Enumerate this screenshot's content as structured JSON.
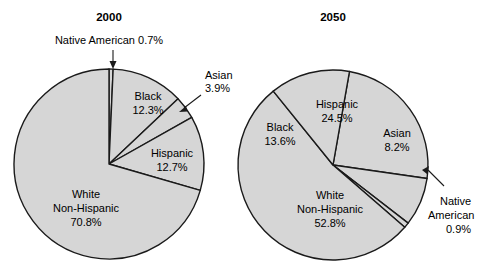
{
  "figure": {
    "background_color": "#ffffff",
    "slice_fill_color": "#d6d6d6",
    "outline_color": "#1a1a1a"
  },
  "chart_data": [
    {
      "type": "pie",
      "title": "2000",
      "categories": [
        "Native American",
        "Black",
        "Asian",
        "Hispanic",
        "White Non-Hispanic"
      ],
      "values": [
        0.7,
        12.3,
        3.9,
        12.7,
        70.8
      ],
      "value_labels": [
        "0.7%",
        "12.3%",
        "3.9%",
        "12.7%",
        "70.8%"
      ],
      "labels": {
        "native_american_name": "Native American",
        "native_american_value": "0.7%",
        "native_american_full": "Native American 0.7%",
        "black_name": "Black",
        "black_value": "12.3%",
        "asian_name": "Asian",
        "asian_value": "3.9%",
        "hispanic_name": "Hispanic",
        "hispanic_value": "12.7%",
        "white_line1": "White",
        "white_line2": "Non-Hispanic",
        "white_value": "70.8%"
      },
      "start_angle_deg": -90,
      "direction": "clockwise",
      "legend": "none",
      "grid": false
    },
    {
      "type": "pie",
      "title": "2050",
      "categories": [
        "Hispanic",
        "Asian",
        "Native American",
        "White Non-Hispanic",
        "Black"
      ],
      "values": [
        24.5,
        8.2,
        0.9,
        52.8,
        13.6
      ],
      "value_labels": [
        "24.5%",
        "8.2%",
        "0.9%",
        "52.8%",
        "13.6%"
      ],
      "labels": {
        "hispanic_name": "Hispanic",
        "hispanic_value": "24.5%",
        "asian_name": "Asian",
        "asian_value": "8.2%",
        "native_american_line1": "Native",
        "native_american_line2": "American",
        "native_american_value": "0.9%",
        "white_line1": "White",
        "white_line2": "Non-Hispanic",
        "white_value": "52.8%",
        "black_name": "Black",
        "black_value": "13.6%"
      },
      "start_angle_deg": -80,
      "direction": "clockwise",
      "legend": "none",
      "grid": false
    }
  ],
  "geometry": {
    "pie1": {
      "cx": 109,
      "cy": 164,
      "r": 95,
      "title_x": 109,
      "title_y": 21
    },
    "pie2": {
      "cx": 333,
      "cy": 165,
      "r": 95,
      "title_x": 333,
      "title_y": 21
    }
  }
}
